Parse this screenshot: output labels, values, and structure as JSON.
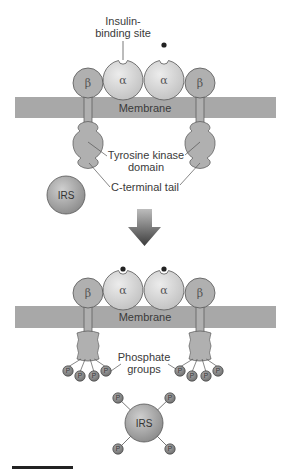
{
  "diagram": {
    "top_state": {
      "labels": {
        "binding_site_line1": "Insulin-",
        "binding_site_line2": "binding site",
        "membrane": "Membrane",
        "tk_domain_line1": "Tyrosine kinase",
        "tk_domain_line2": "domain",
        "c_tail": "C-terminal tail",
        "irs": "IRS"
      },
      "subunits": {
        "alpha": "α",
        "beta": "β"
      }
    },
    "transition": "arrow-down",
    "bottom_state": {
      "labels": {
        "membrane": "Membrane",
        "phosphate_line1": "Phosphate",
        "phosphate_line2": "groups",
        "irs": "IRS",
        "phosphate": "P"
      },
      "subunits": {
        "alpha": "α",
        "beta": "β"
      },
      "phosphates_per_tail": 4,
      "phosphates_on_irs": 4
    },
    "colors": {
      "membrane": "#a8a8a8",
      "protein": "#b0b0b0",
      "alpha": "#d8d8d8",
      "outline": "#555555",
      "insulin": "#222222",
      "arrow": "#5a5a5a",
      "phosphate": "#8a8a8a"
    }
  }
}
